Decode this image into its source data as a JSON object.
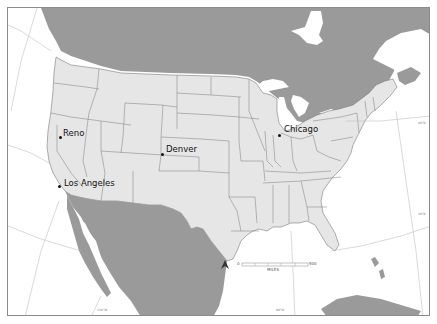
{
  "map": {
    "colors": {
      "usa_fill": "#e6e6e6",
      "foreign_fill": "#9a9a9a",
      "water": "#ffffff",
      "border": "#7a7a7a",
      "graticule": "#b5b5b5",
      "frame": "#8a8a8a"
    },
    "cities": [
      {
        "name": "Reno",
        "dot_x": 60,
        "dot_y": 137,
        "label_x": 63,
        "label_y": 130
      },
      {
        "name": "Denver",
        "dot_x": 162,
        "dot_y": 154,
        "label_x": 166,
        "label_y": 146
      },
      {
        "name": "Chicago",
        "dot_x": 279,
        "dot_y": 135,
        "label_x": 284,
        "label_y": 126
      },
      {
        "name": "Los Angeles",
        "dot_x": 59,
        "dot_y": 186,
        "label_x": 64,
        "label_y": 180
      }
    ],
    "scale_bar": {
      "start_label": "0",
      "end_label": "500",
      "unit_label": "MILES"
    },
    "north_arrow": {
      "label": "N"
    },
    "graticule_labels": [
      {
        "text": "30°N",
        "x": 418,
        "y": 213
      },
      {
        "text": "40°N",
        "x": 418,
        "y": 122
      },
      {
        "text": "110°W",
        "x": 97,
        "y": 309
      },
      {
        "text": "90°W",
        "x": 276,
        "y": 309
      }
    ]
  }
}
